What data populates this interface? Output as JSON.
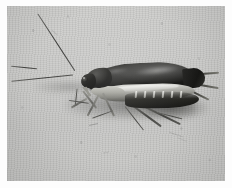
{
  "image": {
    "kind": "photograph",
    "medium": "black-and-white photographic print",
    "subject": "cockroach",
    "subject_detail": "adult cockroach in left-facing profile resting on a pale gray surface",
    "orientation": "landscape",
    "width_px": 232,
    "height_px": 188,
    "border": {
      "present": true,
      "color": "#fdfdfd",
      "thickness_px": 7,
      "description": "white photographic print margin around the image area"
    },
    "plate": {
      "left_px": 7,
      "top_px": 6,
      "width_px": 218,
      "height_px": 175
    }
  },
  "palette": {
    "print_margin": "#fdfdfd",
    "background_light": "#cfcfcd",
    "background_mid": "#c4c4c2",
    "background_dark": "#b6b6b4",
    "body_black": "#161614",
    "body_highlight": "#e6e6e4",
    "abdomen_pale": "#d6d6d1",
    "shadow": "#3d3d3a",
    "leg_gray": "#4e4e4a"
  },
  "scene": {
    "background_label": "pale gray textured surface",
    "lighting": "diffuse overhead light from upper right",
    "shadow_label": "soft cast shadow beneath the body and hind legs",
    "grain_label": "photographic film grain and speckle"
  },
  "subject_parts": [
    {
      "name": "antenna-upper",
      "label": "Upper antenna",
      "direction": "up and to the left",
      "length_px": 68
    },
    {
      "name": "antenna-lower",
      "label": "Lower antenna",
      "direction": "left, nearly horizontal",
      "length_px": 88
    },
    {
      "name": "head",
      "label": "Head",
      "position": "left end of body"
    },
    {
      "name": "eye",
      "label": "Compound eye",
      "position": "front of head"
    },
    {
      "name": "pronotum",
      "label": "Pronotum (head shield)",
      "color": "#1b1b19"
    },
    {
      "name": "tegmina",
      "label": "Wing covers (tegmina)",
      "color": "#161614",
      "length_px": 108
    },
    {
      "name": "abdomen",
      "label": "Abdomen",
      "note": "pale band visible beneath the dark wing covers"
    },
    {
      "name": "front-legs",
      "label": "Front legs",
      "count": 2
    },
    {
      "name": "middle-legs",
      "label": "Middle legs",
      "count": 2
    },
    {
      "name": "hind-legs",
      "label": "Hind legs",
      "count": 2,
      "direction": "trailing down and to the right"
    },
    {
      "name": "cerci",
      "label": "Cerci",
      "count": 2,
      "direction": "right, past the rear of the body"
    }
  ]
}
